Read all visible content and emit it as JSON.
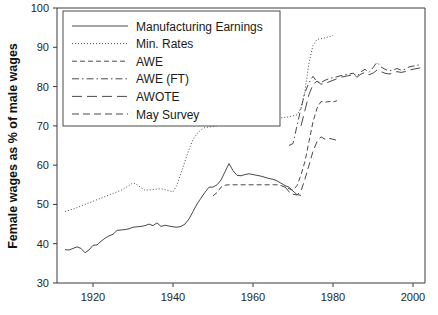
{
  "chart_data": {
    "type": "line",
    "title": "",
    "xlabel": "",
    "ylabel": "Female wages as % of male wages",
    "xlim": [
      1911,
      2003
    ],
    "ylim": [
      30,
      100
    ],
    "xticks": [
      1920,
      1940,
      1960,
      1980,
      2000
    ],
    "yticks": [
      30,
      40,
      50,
      60,
      70,
      80,
      90,
      100
    ],
    "grid": false,
    "legend_position": "top-left",
    "legend_entries": [
      {
        "label": "Manufacturing Earnings",
        "style": "solid"
      },
      {
        "label": "Min. Rates",
        "style": "dotted"
      },
      {
        "label": "AWE",
        "style": "dashed"
      },
      {
        "label": "AWE (FT)",
        "style": "dashdot"
      },
      {
        "label": "AWOTE",
        "style": "longdash"
      },
      {
        "label": "May Survey",
        "style": "mediumdash"
      }
    ],
    "series": [
      {
        "name": "Manufacturing Earnings",
        "style": "solid",
        "x": [
          1913,
          1914,
          1915,
          1916,
          1917,
          1918,
          1919,
          1920,
          1921,
          1922,
          1923,
          1924,
          1925,
          1926,
          1927,
          1928,
          1929,
          1930,
          1931,
          1932,
          1933,
          1934,
          1935,
          1936,
          1937,
          1938,
          1939,
          1940,
          1941,
          1942,
          1943,
          1944,
          1945,
          1946,
          1947,
          1948,
          1949,
          1950,
          1951,
          1952,
          1953,
          1954,
          1955,
          1956,
          1957,
          1958,
          1959,
          1960,
          1961,
          1962,
          1963,
          1964,
          1965,
          1966,
          1967,
          1968,
          1969,
          1970,
          1971,
          1972
        ],
        "y": [
          38.5,
          38.4,
          38.8,
          39.2,
          38.8,
          37.7,
          38.4,
          39.6,
          39.7,
          40.6,
          41.4,
          42.0,
          42.4,
          43.4,
          43.5,
          43.6,
          43.8,
          44.2,
          44.3,
          44.4,
          44.6,
          45.0,
          44.6,
          45.3,
          44.4,
          44.7,
          44.5,
          44.3,
          44.2,
          44.4,
          45.0,
          46.3,
          48.2,
          50.1,
          51.6,
          53.1,
          54.4,
          54.4,
          55.0,
          56.2,
          58.3,
          60.4,
          58.6,
          57.4,
          57.3,
          57.6,
          57.8,
          57.6,
          57.4,
          57.2,
          56.9,
          56.6,
          56.4,
          56.0,
          55.4,
          54.8,
          54.4,
          53.4,
          52.5,
          52.3
        ]
      },
      {
        "name": "Min. Rates",
        "style": "dotted",
        "x": [
          1913,
          1915,
          1917,
          1919,
          1921,
          1923,
          1925,
          1927,
          1929,
          1930,
          1931,
          1933,
          1935,
          1937,
          1939,
          1940,
          1941,
          1942,
          1943,
          1944,
          1945,
          1946,
          1947,
          1948,
          1949,
          1950,
          1952,
          1955,
          1958,
          1960,
          1963,
          1966,
          1969,
          1971,
          1972,
          1973,
          1974,
          1975,
          1976,
          1978,
          1980
        ],
        "y": [
          48.2,
          48.8,
          49.6,
          50.4,
          51.2,
          52.0,
          52.8,
          53.6,
          54.8,
          55.5,
          55.0,
          53.6,
          53.8,
          54.0,
          53.5,
          53.2,
          55.0,
          58.0,
          61.0,
          64.0,
          66.5,
          68.0,
          69.0,
          69.6,
          69.7,
          69.8,
          70.2,
          70.6,
          70.9,
          71.2,
          71.5,
          71.9,
          72.3,
          72.8,
          74.5,
          79.0,
          86.0,
          90.5,
          92.0,
          92.4,
          93.0
        ]
      },
      {
        "name": "AWE",
        "style": "dashed",
        "x": [
          1950,
          1951,
          1952,
          1953,
          1954,
          1955,
          1956,
          1957,
          1958,
          1959,
          1960,
          1961,
          1962,
          1963,
          1964,
          1965,
          1966,
          1967,
          1968,
          1969,
          1970,
          1971,
          1972,
          1973,
          1974,
          1975,
          1976,
          1977,
          1978,
          1979,
          1980,
          1981
        ],
        "y": [
          52.2,
          53.0,
          54.4,
          54.9,
          55.0,
          55.0,
          55.0,
          55.0,
          55.0,
          55.0,
          55.0,
          55.0,
          55.0,
          55.0,
          55.0,
          55.0,
          55.0,
          54.8,
          54.4,
          54.0,
          53.6,
          54.8,
          57.5,
          61.0,
          66.0,
          71.0,
          74.5,
          76.2,
          76.0,
          76.2,
          76.1,
          76.4
        ]
      },
      {
        "name": "AWE (FT)",
        "style": "dashdot",
        "x": [
          1969,
          1970,
          1971,
          1972,
          1973,
          1974,
          1975,
          1976,
          1977,
          1978,
          1979,
          1980,
          1981,
          1982,
          1983,
          1984,
          1985,
          1986,
          1987,
          1988,
          1989,
          1990,
          1991,
          1992,
          1993,
          1994,
          1995,
          1996,
          1997,
          1998,
          1999,
          2000,
          2001,
          2002
        ],
        "y": [
          65.0,
          65.5,
          70.0,
          74.5,
          78.5,
          81.0,
          82.6,
          81.2,
          81.0,
          81.6,
          82.0,
          82.3,
          82.5,
          82.8,
          83.0,
          83.2,
          83.4,
          82.6,
          83.8,
          84.4,
          83.6,
          84.8,
          86.2,
          85.0,
          84.4,
          84.0,
          84.2,
          84.6,
          84.2,
          84.4,
          85.0,
          85.2,
          85.4,
          85.6
        ]
      },
      {
        "name": "AWOTE",
        "style": "longdash",
        "x": [
          1972,
          1973,
          1974,
          1975,
          1976,
          1977,
          1978,
          1979,
          1980,
          1981,
          1982,
          1983,
          1984,
          1985,
          1986,
          1987,
          1988,
          1989,
          1990,
          1991,
          1992,
          1993,
          1994,
          1995,
          1996,
          1997,
          1998,
          1999,
          2000,
          2001,
          2002
        ],
        "y": [
          70.0,
          74.0,
          78.0,
          80.5,
          81.4,
          80.6,
          80.8,
          81.2,
          81.6,
          82.0,
          82.4,
          82.6,
          82.8,
          83.0,
          82.4,
          83.2,
          83.6,
          83.0,
          83.4,
          84.2,
          83.8,
          83.4,
          83.2,
          83.4,
          83.8,
          83.6,
          83.8,
          84.2,
          84.4,
          84.6,
          84.8
        ]
      },
      {
        "name": "May Survey",
        "style": "mediumdash",
        "x": [
          1968,
          1969,
          1970,
          1971,
          1972,
          1973,
          1974,
          1975,
          1976,
          1977,
          1978,
          1979,
          1980,
          1981
        ],
        "y": [
          54.5,
          53.2,
          52.6,
          52.4,
          53.4,
          56.5,
          60.0,
          63.5,
          66.0,
          67.2,
          66.6,
          66.8,
          66.6,
          66.3
        ]
      }
    ]
  }
}
